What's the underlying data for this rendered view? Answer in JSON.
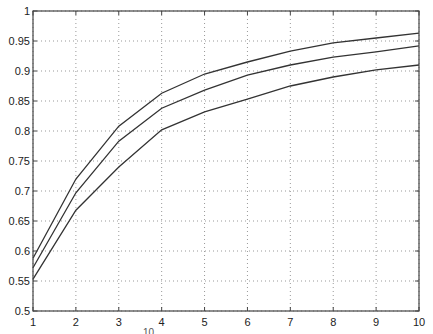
{
  "chart_data": {
    "type": "line",
    "title": "",
    "xlabel": "",
    "ylabel": "",
    "xlim": [
      1,
      10
    ],
    "ylim": [
      0.5,
      1
    ],
    "grid": true,
    "legend": null,
    "x": [
      1,
      2,
      3,
      4,
      5,
      6,
      7,
      8,
      9,
      10
    ],
    "x_ticks": [
      "1",
      "2",
      "3",
      "4",
      "5",
      "6",
      "7",
      "8",
      "9",
      "10"
    ],
    "y_ticks": [
      "0.5",
      "0.55",
      "0.6",
      "0.65",
      "0.7",
      "0.75",
      "0.8",
      "0.85",
      "0.9",
      "0.95",
      "1"
    ],
    "series": [
      {
        "name": "upper",
        "values": [
          0.588,
          0.72,
          0.808,
          0.863,
          0.895,
          0.915,
          0.933,
          0.947,
          0.955,
          0.963
        ]
      },
      {
        "name": "middle",
        "values": [
          0.572,
          0.697,
          0.783,
          0.838,
          0.868,
          0.893,
          0.91,
          0.923,
          0.932,
          0.942
        ]
      },
      {
        "name": "lower",
        "values": [
          0.553,
          0.668,
          0.74,
          0.802,
          0.832,
          0.853,
          0.875,
          0.89,
          0.902,
          0.91
        ]
      }
    ],
    "colors": {
      "line": "#333333",
      "grid": "#999999",
      "axis": "#444444"
    }
  },
  "cut_off_text": "10"
}
